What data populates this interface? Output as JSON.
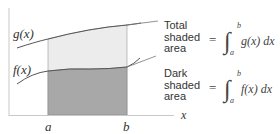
{
  "diagram": {
    "curves": {
      "upper": {
        "label": "g(x)"
      },
      "lower": {
        "label": "f(x)"
      }
    },
    "axes": {
      "x_label": "x",
      "a_label": "a",
      "b_label": "b"
    },
    "annotations": [
      {
        "line1": "Total",
        "line2": "shaded",
        "line3": "area",
        "equation": "= ∫ₐᵇ g(x) dx",
        "eq_parts": {
          "eq": "=",
          "upper": "b",
          "lower": "a",
          "integrand": "g(x) dx"
        }
      },
      {
        "line1": "Dark",
        "line2": "shaded",
        "line3": "area",
        "equation": "= ∫ₐᵇ f(x) dx",
        "eq_parts": {
          "eq": "=",
          "upper": "b",
          "lower": "a",
          "integrand": "f(x) dx"
        }
      }
    ],
    "colors": {
      "light_fill": "#eaeaea",
      "dark_fill": "#a9a9a9",
      "curve": "#555555",
      "axis": "#c8c8c8"
    }
  }
}
